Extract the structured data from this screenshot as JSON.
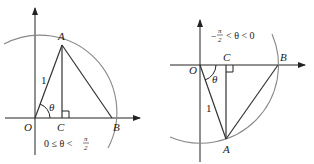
{
  "figures": [
    {
      "id": "left",
      "points": {
        "O": "O",
        "A": "A",
        "B": "B",
        "C": "C"
      },
      "radius_label": "1",
      "angle_label": "θ",
      "condition": {
        "left": "0 ≤ θ <",
        "num": "π",
        "den": "2"
      }
    },
    {
      "id": "right",
      "points": {
        "O": "O",
        "A": "A",
        "B": "B",
        "C": "C"
      },
      "radius_label": "1",
      "angle_label": "θ",
      "condition": {
        "minus": "−",
        "num": "π",
        "den": "2",
        "right": "< θ < 0"
      }
    }
  ],
  "colors": {
    "lines": "#333333",
    "arc": "#888888",
    "background": "#ffffff"
  }
}
